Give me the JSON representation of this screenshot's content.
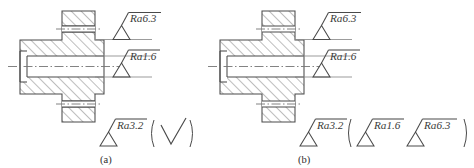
{
  "figure": {
    "background_color": "#ffffff",
    "line_color": "#4a4a4a",
    "hatch_color": "#5a5a5a",
    "center_line_color": "#6e6e6e",
    "text_color": "#3a3a3a"
  },
  "panels": [
    {
      "caption": "(a)",
      "labels": [
        {
          "name": "top-surface",
          "text": "Ra6.3"
        },
        {
          "name": "bore-surface",
          "text": "Ra1.6"
        },
        {
          "name": "general-surface",
          "text": "Ra3.2"
        }
      ],
      "bracket_symbols": [
        {
          "name": "basic-symbol",
          "text": ""
        }
      ]
    },
    {
      "caption": "(b)",
      "labels": [
        {
          "name": "top-surface",
          "text": "Ra6.3"
        },
        {
          "name": "bore-surface",
          "text": "Ra1.6"
        },
        {
          "name": "general-surface",
          "text": "Ra3.2"
        }
      ],
      "bracket_symbols": [
        {
          "name": "bracket-symbol-1",
          "text": "Ra1.6"
        },
        {
          "name": "bracket-symbol-2",
          "text": "Ra6.3"
        }
      ]
    }
  ]
}
